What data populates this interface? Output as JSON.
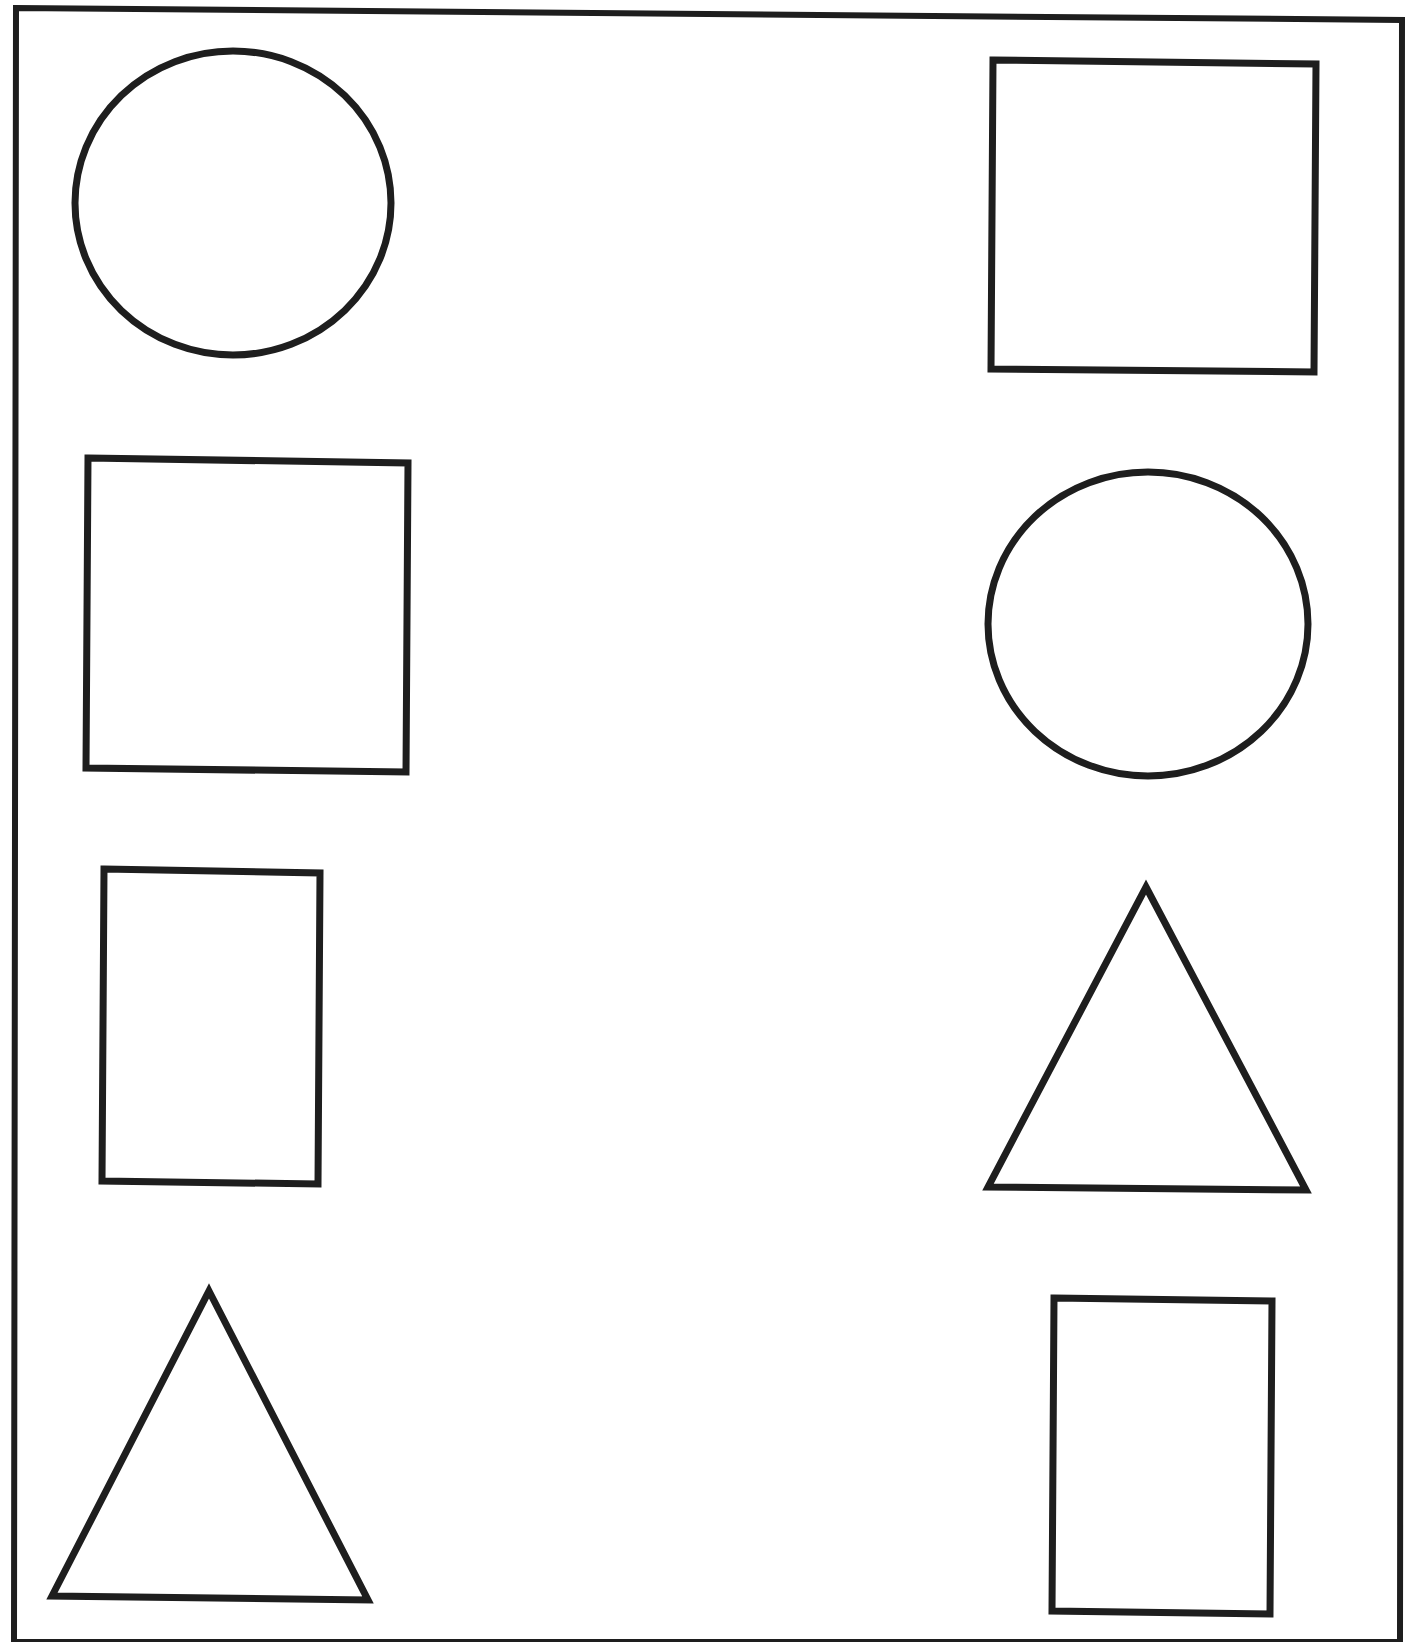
{
  "worksheet": {
    "stroke_color": "#1e1e1e",
    "background": "#ffffff",
    "frame": {
      "points": "16,8 1402,20 1400,1642 14,1642"
    },
    "left_column": [
      {
        "type": "circle",
        "label": "circle",
        "cx": 233,
        "cy": 203,
        "rx": 158,
        "ry": 152
      },
      {
        "type": "rect",
        "label": "square",
        "points": "88,458 408,463 406,772 86,768"
      },
      {
        "type": "rect",
        "label": "rectangle",
        "points": "104,869 320,873 318,1184 102,1181"
      },
      {
        "type": "triangle",
        "label": "triangle",
        "points": "209,1291 368,1600 52,1596"
      }
    ],
    "right_column": [
      {
        "type": "rect",
        "label": "square",
        "points": "993,60 1316,64 1314,372 991,369"
      },
      {
        "type": "circle",
        "label": "circle",
        "cx": 1148,
        "cy": 624,
        "rx": 160,
        "ry": 152
      },
      {
        "type": "triangle",
        "label": "triangle",
        "points": "1146,887 1306,1190 988,1187"
      },
      {
        "type": "rect",
        "label": "rectangle",
        "points": "1054,1298 1272,1301 1270,1614 1052,1611"
      }
    ]
  }
}
